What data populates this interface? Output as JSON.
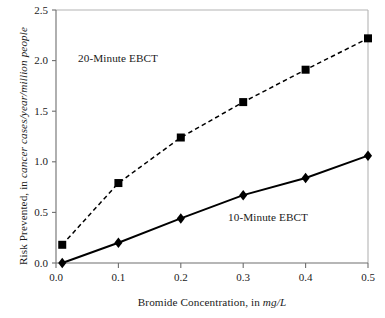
{
  "chart_data": {
    "type": "line",
    "title": "",
    "subtitle": "",
    "xlabel_plain": "Bromide Concentration, in ",
    "xlabel_italic": "mg/L",
    "ylabel_plain": "Risk Prevented, in ",
    "ylabel_italic": "cancer cases/year/million people",
    "xlim": [
      0.0,
      0.5
    ],
    "ylim": [
      0.0,
      2.5
    ],
    "xticks": [
      "0.0",
      "0.1",
      "0.2",
      "0.3",
      "0.4",
      "0.5"
    ],
    "xtick_values": [
      0.0,
      0.1,
      0.2,
      0.3,
      0.4,
      0.5
    ],
    "yticks": [
      "0.0",
      "0.5",
      "1.0",
      "1.5",
      "2.0",
      "2.5"
    ],
    "ytick_values": [
      0.0,
      0.5,
      1.0,
      1.5,
      2.0,
      2.5
    ],
    "grid": false,
    "legend_position": "inline-annotations",
    "series": [
      {
        "name": "20-Minute EBCT",
        "marker": "square",
        "linestyle": "dashed",
        "color": "#000000",
        "x": [
          0.01,
          0.1,
          0.2,
          0.3,
          0.4,
          0.5
        ],
        "values": [
          0.18,
          0.79,
          1.24,
          1.59,
          1.91,
          2.22
        ]
      },
      {
        "name": "10-Minute EBCT",
        "marker": "diamond",
        "linestyle": "solid",
        "color": "#000000",
        "x": [
          0.01,
          0.1,
          0.2,
          0.3,
          0.4,
          0.5
        ],
        "values": [
          0.0,
          0.2,
          0.44,
          0.67,
          0.84,
          1.06
        ]
      }
    ],
    "annotations": [
      {
        "text": "20-Minute EBCT",
        "x": 0.06,
        "y": 2.08
      },
      {
        "text": "10-Minute EBCT",
        "x": 0.3,
        "y": 0.3
      }
    ]
  }
}
